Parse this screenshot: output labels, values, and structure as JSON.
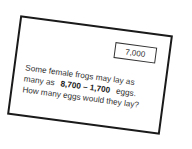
{
  "card": {
    "answer_value": "7,000",
    "question": {
      "line1": "Some female frogs may lay as",
      "line2_prefix": "many as",
      "expression": "8,700 – 1,700",
      "line2_suffix": "eggs.",
      "line3": "How many eggs would they lay?"
    }
  }
}
